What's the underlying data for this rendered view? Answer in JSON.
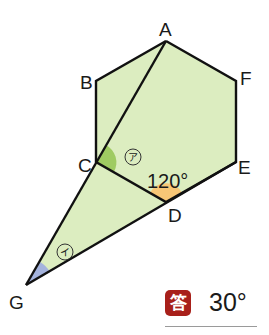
{
  "diagram": {
    "type": "geometry",
    "shape": "regular hexagon ABCDEF with extended triangle",
    "vertices": {
      "A": {
        "label": "A"
      },
      "B": {
        "label": "B"
      },
      "C": {
        "label": "C"
      },
      "D": {
        "label": "D"
      },
      "E": {
        "label": "E"
      },
      "F": {
        "label": "F"
      },
      "G": {
        "label": "G"
      }
    },
    "angles": {
      "given": {
        "label": "120°",
        "at": "D"
      },
      "a": {
        "mark": "ア",
        "at": "C"
      },
      "i": {
        "mark": "イ",
        "at": "G"
      }
    },
    "colors": {
      "fill": "#dcedc0",
      "stroke": "#111111",
      "angle_a": "#9fcb62",
      "angle_given": "#f7c676",
      "angle_i": "#a4b3dd"
    }
  },
  "answer": {
    "badge": "答",
    "value": "30°",
    "badge_color": "#a8201a"
  }
}
